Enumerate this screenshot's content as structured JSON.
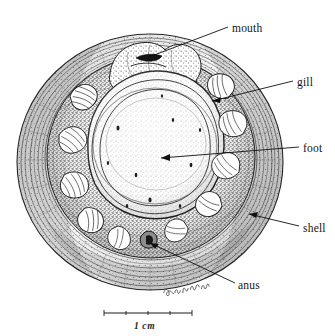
{
  "figure": {
    "kind": "scientific-line-drawing",
    "medium": "pen-and-ink stipple and hatching, black on white",
    "background_color": "#ffffff",
    "ink_color": "#1a1a1a",
    "signature": "artist-signature"
  },
  "labels": [
    {
      "id": "mouth",
      "text": "mouth",
      "text_x": 232,
      "text_y": 30,
      "leader": {
        "x1": 228,
        "y1": 27,
        "x2": 149,
        "y2": 57
      },
      "arrow": "none"
    },
    {
      "id": "gill",
      "text": "gill",
      "text_x": 297,
      "text_y": 84,
      "leader": {
        "x1": 293,
        "y1": 81,
        "x2": 212,
        "y2": 101
      },
      "arrow": "end"
    },
    {
      "id": "foot",
      "text": "foot",
      "text_x": 303,
      "text_y": 150,
      "leader": {
        "x1": 299,
        "y1": 147,
        "x2": 161,
        "y2": 158
      },
      "arrow": "end"
    },
    {
      "id": "shell",
      "text": "shell",
      "text_x": 303,
      "text_y": 230,
      "leader": {
        "x1": 299,
        "y1": 226,
        "x2": 249,
        "y2": 214
      },
      "arrow": "end"
    },
    {
      "id": "anus",
      "text": "anus",
      "text_x": 238,
      "text_y": 287,
      "leader": {
        "x1": 235,
        "y1": 283,
        "x2": 150,
        "y2": 243
      },
      "arrow": "end"
    }
  ],
  "scale_bar": {
    "caption": "1 cm",
    "x1": 104,
    "x2": 192,
    "y": 313,
    "caption_x": 148,
    "caption_y": 329
  }
}
